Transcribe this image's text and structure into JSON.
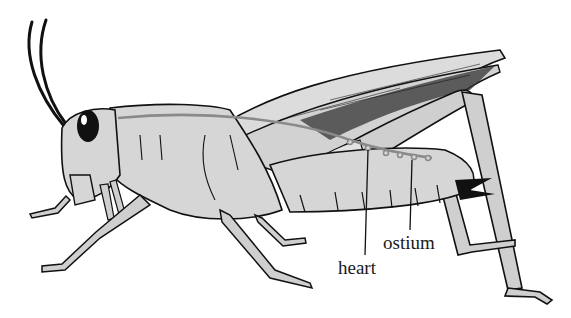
{
  "diagram": {
    "colors": {
      "background": "#ffffff",
      "body_fill": "#d6d6d6",
      "outline": "#111111",
      "vessel": "#8a8a8a",
      "wing_fill": "#dcdcdc"
    },
    "labels": [
      {
        "id": "heart",
        "text": "heart",
        "x": 338,
        "y": 258
      },
      {
        "id": "ostium",
        "text": "ostium",
        "x": 383,
        "y": 233
      }
    ]
  }
}
